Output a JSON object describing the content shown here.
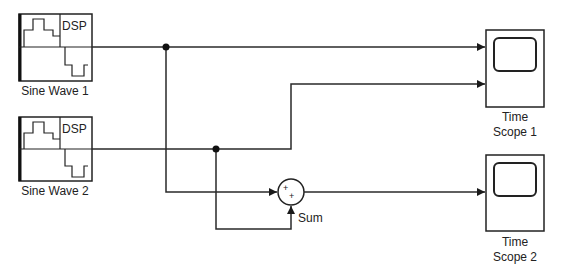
{
  "diagram": {
    "type": "simulink-block-diagram",
    "colors": {
      "line": "#2a2a2a",
      "background": "#ffffff"
    },
    "blocks": [
      {
        "id": "sine1",
        "kind": "signal-source",
        "label": "Sine Wave 1",
        "icon_text": "DSP"
      },
      {
        "id": "sine2",
        "kind": "signal-source",
        "label": "Sine Wave 2",
        "icon_text": "DSP"
      },
      {
        "id": "sum",
        "kind": "sum",
        "label": "Sum",
        "signs": [
          "+",
          "+"
        ]
      },
      {
        "id": "scope1",
        "kind": "time-scope",
        "label_line1": "Time",
        "label_line2": "Scope 1",
        "inputs": 2
      },
      {
        "id": "scope2",
        "kind": "time-scope",
        "label_line1": "Time",
        "label_line2": "Scope 2",
        "inputs": 1
      }
    ],
    "connections": [
      {
        "from": "sine1",
        "to": "scope1",
        "port": 1
      },
      {
        "from": "sine2",
        "to": "scope1",
        "port": 2
      },
      {
        "from": "sine1",
        "to": "sum",
        "port": 1
      },
      {
        "from": "sine2",
        "to": "sum",
        "port": 2
      },
      {
        "from": "sum",
        "to": "scope2",
        "port": 1
      }
    ]
  }
}
